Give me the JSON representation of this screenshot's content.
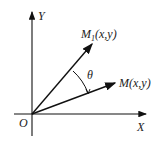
{
  "diagram": {
    "axes": {
      "x_label": "X",
      "y_label": "Y",
      "origin_label": "O"
    },
    "vectors": [
      {
        "name": "M",
        "sub": "1",
        "args": "(x,y)"
      },
      {
        "name": "M",
        "sub": "",
        "args": "(x,y)"
      }
    ],
    "angle_label": "θ"
  }
}
